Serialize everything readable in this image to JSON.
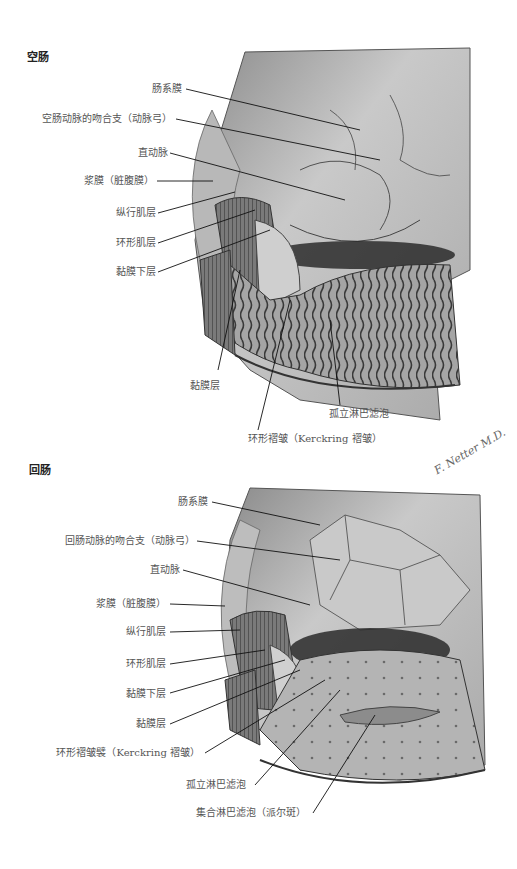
{
  "figure": {
    "panels": [
      {
        "title": "空肠",
        "labels": [
          "肠系膜",
          "空肠动脉的吻合支（动脉弓）",
          "直动脉",
          "浆膜（脏腹膜）",
          "纵行肌层",
          "环形肌层",
          "黏膜下层",
          "黏膜层",
          "孤立淋巴滤泡",
          "环形褶皱（Kerckring 褶皱）"
        ]
      },
      {
        "title": "回肠",
        "labels": [
          "肠系膜",
          "回肠动脉的吻合支（动脉弓）",
          "直动脉",
          "浆膜（脏腹膜）",
          "纵行肌层",
          "环形肌层",
          "黏膜下层",
          "黏膜层",
          "环形褶皱襞（Kerckring 褶皱）",
          "孤立淋巴滤泡",
          "集合淋巴滤泡（派尔斑）"
        ]
      }
    ],
    "signature": "F. Netter M.D."
  }
}
